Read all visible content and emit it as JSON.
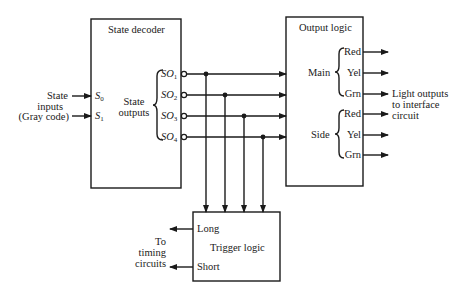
{
  "diagram": {
    "type": "block-diagram",
    "blocks": {
      "state_decoder": {
        "title": "State decoder",
        "inputs": [
          {
            "sym": "S",
            "sub": "0"
          },
          {
            "sym": "S",
            "sub": "1"
          }
        ],
        "outputs_label": [
          "State",
          "outputs"
        ],
        "outputs": [
          {
            "sym": "SO",
            "sub": "1"
          },
          {
            "sym": "SO",
            "sub": "2"
          },
          {
            "sym": "SO",
            "sub": "3"
          },
          {
            "sym": "SO",
            "sub": "4"
          }
        ]
      },
      "output_logic": {
        "title": "Output logic",
        "groups": [
          {
            "name": "Main",
            "signals": [
              "Red",
              "Yel",
              "Grn"
            ]
          },
          {
            "name": "Side",
            "signals": [
              "Red",
              "Yel",
              "Grn"
            ]
          }
        ]
      },
      "trigger_logic": {
        "title": "Trigger logic",
        "outputs": [
          "Long",
          "Short"
        ]
      }
    },
    "external_labels": {
      "state_inputs": [
        "State",
        "inputs",
        "(Gray code)"
      ],
      "light_outputs": [
        "Light outputs",
        "to interface",
        "circuit"
      ],
      "timing": [
        "To",
        "timing",
        "circuits"
      ]
    },
    "colors": {
      "line": "#1a1a1a",
      "background": "#ffffff"
    }
  }
}
